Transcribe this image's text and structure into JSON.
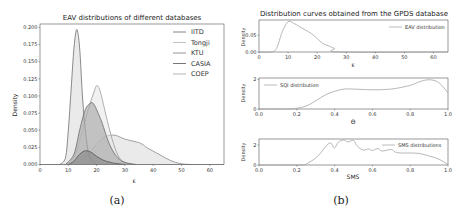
{
  "panel_a": {
    "caption": "(a)",
    "title": "EAV distributions of different databases",
    "xlabel": "ε",
    "ylabel": "Density",
    "xticks": [
      "0",
      "10",
      "20",
      "30",
      "40",
      "50",
      "60"
    ],
    "yticks": [
      "0.000",
      "0.025",
      "0.050",
      "0.075",
      "0.100",
      "0.125",
      "0.150",
      "0.175",
      "0.200"
    ],
    "legend": [
      "IITD",
      "Tongji",
      "KTU",
      "CASIA",
      "COEP"
    ]
  },
  "panel_b": {
    "caption": "(b)",
    "title": "Distribution curves obtained from the GPDS database",
    "top": {
      "legend": "EAV distribution",
      "xlabel": "ε",
      "ylabel": "Density",
      "xticks": [
        "0",
        "10",
        "20",
        "30",
        "40",
        "50",
        "60"
      ],
      "yticks": [
        "0.00",
        "0.05"
      ]
    },
    "middle": {
      "legend": "SQI distribution",
      "xlabel": "Θ",
      "ylabel": "Density",
      "xticks": [
        "0.0",
        "0.2",
        "0.4",
        "0.6",
        "0.8",
        "1.0"
      ],
      "yticks": [
        "0",
        "2"
      ]
    },
    "bottom": {
      "legend": "SMS distributions",
      "xlabel": "SMS",
      "ylabel": "Density",
      "xticks": [
        "0.0",
        "0.2",
        "0.4",
        "0.6",
        "0.8",
        "1.0"
      ],
      "yticks": [
        "0",
        "2"
      ]
    }
  },
  "chart_data": [
    {
      "type": "area",
      "title": "EAV distributions of different databases",
      "xlabel": "ε",
      "ylabel": "Density",
      "xlim": [
        0,
        65
      ],
      "ylim": [
        0,
        0.205
      ],
      "legend_position": "upper right",
      "grid": false,
      "series": [
        {
          "name": "IITD",
          "x": [
            7,
            9,
            10,
            11,
            12,
            13,
            14,
            15,
            16,
            17,
            18,
            20
          ],
          "values": [
            0,
            0.01,
            0.05,
            0.11,
            0.17,
            0.197,
            0.17,
            0.1,
            0.05,
            0.02,
            0.008,
            0
          ]
        },
        {
          "name": "Tongji",
          "x": [
            9,
            12,
            15,
            17,
            19,
            20,
            21,
            22,
            24,
            26,
            28,
            30,
            32
          ],
          "values": [
            0,
            0.01,
            0.05,
            0.08,
            0.105,
            0.115,
            0.11,
            0.095,
            0.06,
            0.03,
            0.01,
            0.003,
            0
          ]
        },
        {
          "name": "KTU",
          "x": [
            9,
            12,
            14,
            16,
            18,
            19,
            20,
            22,
            24,
            26,
            28,
            30,
            34
          ],
          "values": [
            0,
            0.015,
            0.05,
            0.08,
            0.09,
            0.088,
            0.08,
            0.06,
            0.035,
            0.018,
            0.008,
            0.003,
            0
          ]
        },
        {
          "name": "CASIA",
          "x": [
            10,
            12,
            14,
            16,
            18,
            20,
            22,
            24,
            26,
            28,
            30
          ],
          "values": [
            0,
            0.005,
            0.015,
            0.02,
            0.018,
            0.012,
            0.007,
            0.004,
            0.002,
            0.001,
            0
          ]
        },
        {
          "name": "COEP",
          "x": [
            10,
            14,
            18,
            22,
            26,
            30,
            34,
            36,
            38,
            42,
            46,
            50,
            54
          ],
          "values": [
            0,
            0.005,
            0.02,
            0.038,
            0.043,
            0.037,
            0.033,
            0.03,
            0.024,
            0.015,
            0.006,
            0.001,
            0
          ]
        }
      ]
    },
    {
      "type": "line",
      "title": "Distribution curves obtained from the GPDS database",
      "xlabel": "ε",
      "ylabel": "Density",
      "xlim": [
        0,
        65
      ],
      "ylim": [
        0,
        0.095
      ],
      "series": [
        {
          "name": "EAV distribution",
          "x": [
            0,
            4,
            6,
            8,
            10,
            12,
            14,
            16,
            18,
            20,
            22,
            24,
            26,
            28,
            65
          ],
          "values": [
            0,
            0,
            0.01,
            0.06,
            0.09,
            0.085,
            0.075,
            0.065,
            0.055,
            0.04,
            0.025,
            0.018,
            0.01,
            0,
            0
          ]
        }
      ]
    },
    {
      "type": "line",
      "xlabel": "Θ",
      "ylabel": "Density",
      "xlim": [
        0,
        1
      ],
      "ylim": [
        0,
        2.1
      ],
      "series": [
        {
          "name": "SQI distribution",
          "x": [
            0,
            0.15,
            0.2,
            0.25,
            0.3,
            0.35,
            0.4,
            0.45,
            0.5,
            0.6,
            0.7,
            0.8,
            0.85,
            0.9,
            0.95,
            1.0
          ],
          "values": [
            0,
            0,
            0.05,
            0.2,
            0.55,
            0.95,
            1.2,
            1.35,
            1.35,
            1.3,
            1.35,
            1.6,
            1.85,
            1.98,
            1.8,
            1.1
          ]
        }
      ]
    },
    {
      "type": "line",
      "xlabel": "SMS",
      "ylabel": "Density",
      "xlim": [
        0,
        1
      ],
      "ylim": [
        0,
        2.6
      ],
      "series": [
        {
          "name": "SMS distributions",
          "x": [
            0,
            0.22,
            0.25,
            0.3,
            0.33,
            0.36,
            0.38,
            0.4,
            0.42,
            0.45,
            0.47,
            0.5,
            0.52,
            0.55,
            0.58,
            0.6,
            0.63,
            0.65,
            0.7,
            0.72,
            0.75,
            0.8,
            0.85,
            0.9,
            0.95,
            1.0
          ],
          "values": [
            0,
            0,
            0.1,
            0.7,
            1.3,
            2.0,
            2.2,
            1.7,
            2.3,
            2.5,
            2.3,
            2.45,
            1.9,
            1.5,
            1.6,
            1.45,
            1.65,
            1.4,
            1.55,
            1.3,
            1.2,
            1.2,
            1.15,
            0.9,
            0.6,
            0.05
          ]
        }
      ]
    }
  ]
}
